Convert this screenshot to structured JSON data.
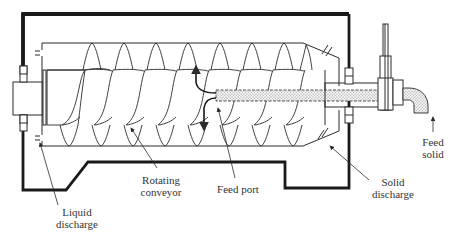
{
  "diagram": {
    "colors": {
      "line": "#2b2b2b",
      "housing": "#1a1a1a",
      "text": "#333333",
      "feed_fill": "#cfcfcf"
    },
    "labels": {
      "liquid_discharge": {
        "line1": "Liquid",
        "line2": "discharge"
      },
      "rotating_conveyor": {
        "line1": "Rotating",
        "line2": "conveyor"
      },
      "feed_port": {
        "line1": "Feed port"
      },
      "solid_discharge": {
        "line1": "Solid",
        "line2": "discharge"
      },
      "feed_solid": {
        "line1": "Feed",
        "line2": "solid"
      }
    }
  }
}
